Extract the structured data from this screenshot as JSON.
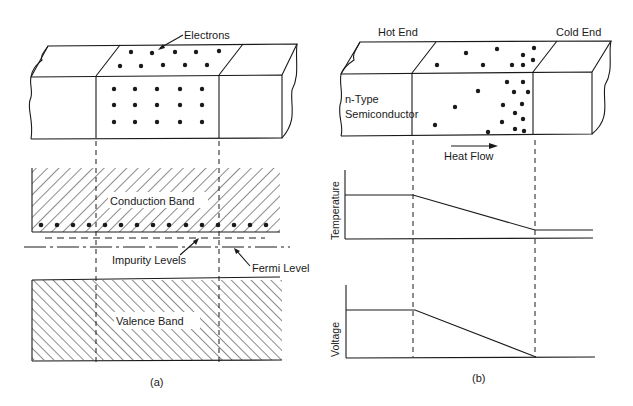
{
  "panel_a": {
    "caption": "(a)",
    "labels": {
      "electrons": "Electrons",
      "conduction_band": "Conduction Band",
      "impurity_levels": "Impurity Levels",
      "fermi_level": "Fermi Level",
      "valence_band": "Valence Band"
    },
    "dot_grid_front": {
      "rows": 3,
      "cols": 5
    },
    "dot_grid_top": {
      "rows": 2,
      "cols": 5
    }
  },
  "panel_b": {
    "caption": "(b)",
    "labels": {
      "hot_end": "Hot End",
      "cold_end": "Cold End",
      "material": "n-Type",
      "material_2": "Semiconductor",
      "heat_flow": "Heat Flow",
      "temperature_axis": "Temperature",
      "voltage_axis": "Voltage"
    }
  },
  "colors": {
    "ink": "#1a1a1a",
    "background": "#ffffff"
  }
}
